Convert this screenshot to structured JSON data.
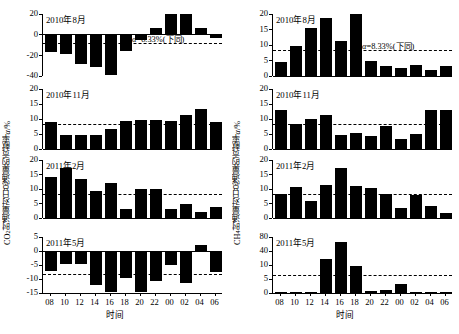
{
  "figure": {
    "xaxis_caption": "时间",
    "xtick_labels": [
      "08",
      "10",
      "12",
      "14",
      "16",
      "18",
      "20",
      "22",
      "00",
      "02",
      "04",
      "06"
    ],
    "alpha_note": "α=8.33%(下同)",
    "alpha_note_plain": "=8.33%(下同)",
    "alpha_symbol": "α",
    "alpha_value": 8.33,
    "ink_color": "#000000",
    "background_color": "#ffffff"
  },
  "columns": [
    {
      "id": "co2",
      "ylabel_prefix": "CO",
      "ylabel_sub": "2",
      "ylabel_suffix": "时通量对日总通量的贡献率",
      "ylabel_italic": "α",
      "ylabel_unit": "/%"
    },
    {
      "id": "ch4",
      "ylabel_prefix": "CH",
      "ylabel_sub": "4",
      "ylabel_suffix": "时通量对日总通量的贡献率",
      "ylabel_italic": "α",
      "ylabel_unit": "/%"
    }
  ],
  "chart_data": [
    {
      "type": "bar",
      "panel_id": "co2-2010-08",
      "column": "co2",
      "row": 0,
      "title": "2010年8月",
      "xlabel": "时间",
      "ylabel": "CO2时通量对日总通量的贡献率α/%",
      "categories": [
        "08",
        "10",
        "12",
        "14",
        "16",
        "18",
        "20",
        "22",
        "00",
        "02",
        "04",
        "06"
      ],
      "values": [
        -16.5,
        -19.0,
        -28.5,
        -31.5,
        -39.0,
        -15.5,
        -5.0,
        6.0,
        20.0,
        20.0,
        6.5,
        -3.0
      ],
      "ylim": [
        -40,
        20
      ],
      "yticks": [
        -40,
        -20,
        0,
        20
      ],
      "ytick_labels": [
        "-40",
        "-20",
        "0",
        "20"
      ],
      "nonlinear_axis": false,
      "reference_line": -8.33,
      "reference_label": "α=8.33%(下同)",
      "show_reference_label": true,
      "grid": false
    },
    {
      "type": "bar",
      "panel_id": "co2-2010-11",
      "column": "co2",
      "row": 1,
      "title": "2010年11月",
      "xlabel": "时间",
      "ylabel": "CO2时通量对日总通量的贡献率α/%",
      "categories": [
        "08",
        "10",
        "12",
        "14",
        "16",
        "18",
        "20",
        "22",
        "00",
        "02",
        "04",
        "06"
      ],
      "values": [
        9.0,
        4.6,
        4.7,
        4.7,
        6.7,
        9.3,
        9.7,
        9.7,
        9.4,
        11.2,
        13.2,
        9.1
      ],
      "ylim": [
        0,
        20
      ],
      "yticks": [
        0,
        5,
        10,
        15,
        20
      ],
      "ytick_labels": [
        "0",
        "5",
        "10",
        "15",
        "20"
      ],
      "nonlinear_axis": false,
      "reference_line": 8.33,
      "reference_label": "α=8.33%",
      "show_reference_label": false,
      "grid": false
    },
    {
      "type": "bar",
      "panel_id": "co2-2011-02",
      "column": "co2",
      "row": 2,
      "title": "2011年2月",
      "xlabel": "时间",
      "ylabel": "CO2时通量对日总通量的贡献率α/%",
      "categories": [
        "08",
        "10",
        "12",
        "14",
        "16",
        "18",
        "20",
        "22",
        "00",
        "02",
        "04",
        "06"
      ],
      "values": [
        14.2,
        17.3,
        13.4,
        9.2,
        12.1,
        3.2,
        9.9,
        10.1,
        3.2,
        4.8,
        2.0,
        3.8
      ],
      "ylim": [
        0,
        20
      ],
      "yticks": [
        0,
        5,
        10,
        15,
        20
      ],
      "ytick_labels": [
        "0",
        "5",
        "10",
        "15",
        "20"
      ],
      "nonlinear_axis": false,
      "reference_line": 8.33,
      "reference_label": "α=8.33%",
      "show_reference_label": false,
      "grid": false
    },
    {
      "type": "bar",
      "panel_id": "co2-2011-05",
      "column": "co2",
      "row": 3,
      "title": "2011年5月",
      "xlabel": "时间",
      "ylabel": "CO2时通量对日总通量的贡献率α/%",
      "categories": [
        "08",
        "10",
        "12",
        "14",
        "16",
        "18",
        "20",
        "22",
        "00",
        "02",
        "04",
        "06"
      ],
      "values": [
        -7.3,
        -4.6,
        -4.7,
        -12.3,
        -14.8,
        -9.5,
        -14.5,
        -10.7,
        -5.1,
        -11.6,
        2.1,
        -7.5
      ],
      "ylim": [
        -15,
        5
      ],
      "yticks": [
        -15,
        -10,
        -5,
        0,
        5
      ],
      "ytick_labels": [
        "-15",
        "-10",
        "-5",
        "0",
        "5"
      ],
      "nonlinear_axis": false,
      "reference_line": -8.33,
      "reference_label": "α=8.33%",
      "show_reference_label": false,
      "grid": false
    },
    {
      "type": "bar",
      "panel_id": "ch4-2010-08",
      "column": "ch4",
      "row": 0,
      "title": "2010年8月",
      "xlabel": "时间",
      "ylabel": "CH4时通量对日总通量的贡献率α/%",
      "categories": [
        "08",
        "10",
        "12",
        "14",
        "16",
        "18",
        "20",
        "22",
        "00",
        "02",
        "04",
        "06"
      ],
      "values": [
        4.5,
        9.7,
        15.6,
        18.7,
        11.4,
        20.0,
        5.0,
        3.1,
        2.5,
        3.4,
        1.9,
        3.2
      ],
      "ylim": [
        0,
        20
      ],
      "yticks": [
        0,
        5,
        10,
        15,
        20
      ],
      "ytick_labels": [
        "0",
        "5",
        "10",
        "15",
        "20"
      ],
      "nonlinear_axis": false,
      "reference_line": 8.33,
      "reference_label": "α=8.33%(下同)",
      "show_reference_label": true,
      "grid": false
    },
    {
      "type": "bar",
      "panel_id": "ch4-2010-11",
      "column": "ch4",
      "row": 1,
      "title": "2010年11月",
      "xlabel": "时间",
      "ylabel": "CH4时通量对日总通量的贡献率α/%",
      "categories": [
        "08",
        "10",
        "12",
        "14",
        "16",
        "18",
        "20",
        "22",
        "00",
        "02",
        "04",
        "06"
      ],
      "values": [
        12.9,
        8.2,
        9.9,
        11.5,
        4.7,
        5.2,
        4.3,
        7.8,
        3.4,
        5.1,
        12.9,
        12.9
      ],
      "ylim": [
        0,
        20
      ],
      "yticks": [
        0,
        5,
        10,
        15,
        20
      ],
      "ytick_labels": [
        "0",
        "5",
        "10",
        "15",
        "20"
      ],
      "nonlinear_axis": false,
      "reference_line": 8.33,
      "reference_label": "α=8.33%",
      "show_reference_label": false,
      "grid": false
    },
    {
      "type": "bar",
      "panel_id": "ch4-2011-02",
      "column": "ch4",
      "row": 2,
      "title": "2011年2月",
      "xlabel": "时间",
      "ylabel": "CH4时通量对日总通量的贡献率α/%",
      "categories": [
        "08",
        "10",
        "12",
        "14",
        "16",
        "18",
        "20",
        "22",
        "00",
        "02",
        "04",
        "06"
      ],
      "values": [
        8.2,
        10.6,
        5.9,
        11.3,
        17.1,
        10.9,
        10.5,
        8.3,
        3.3,
        7.9,
        4.1,
        1.8
      ],
      "ylim": [
        0,
        20
      ],
      "yticks": [
        0,
        5,
        10,
        15,
        20
      ],
      "ytick_labels": [
        "0",
        "5",
        "10",
        "15",
        "20"
      ],
      "nonlinear_axis": false,
      "reference_line": 8.33,
      "reference_label": "α=8.33%",
      "show_reference_label": false,
      "grid": false
    },
    {
      "type": "bar",
      "panel_id": "ch4-2011-05",
      "column": "ch4",
      "row": 3,
      "title": "2011年5月",
      "xlabel": "时间",
      "ylabel": "CH4时通量对日总通量的贡献率α/%",
      "categories": [
        "08",
        "10",
        "12",
        "14",
        "16",
        "18",
        "20",
        "22",
        "00",
        "02",
        "04",
        "06"
      ],
      "values": [
        0.3,
        0.3,
        0.4,
        22.0,
        65.0,
        9.5,
        0.8,
        0.9,
        3.2,
        0.2,
        0.2,
        0.2
      ],
      "ylim": [
        0,
        80
      ],
      "yticks": [
        0,
        5,
        10,
        40,
        80
      ],
      "ytick_labels": [
        "0",
        "5",
        "10",
        "40",
        "80"
      ],
      "nonlinear_axis": true,
      "axis_note": "broken axis: 0-10 expanded, 10-80 compressed",
      "reference_line": 6.5,
      "reference_label": "α=8.33%",
      "show_reference_label": false,
      "grid": false
    }
  ]
}
